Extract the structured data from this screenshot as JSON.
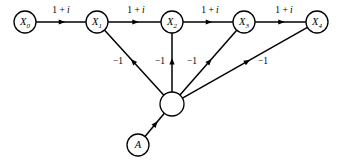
{
  "diagram": {
    "type": "signal-flow-graph",
    "title": "",
    "background_color": "#ffffff",
    "stroke_color": "#000000",
    "nodes": [
      {
        "id": "X0",
        "label": "X",
        "subscript": "0",
        "x": 25,
        "y": 22,
        "r": 11,
        "filled": false
      },
      {
        "id": "X1",
        "label": "X",
        "subscript": "1",
        "x": 97,
        "y": 22,
        "r": 11,
        "filled": false
      },
      {
        "id": "X2",
        "label": "X",
        "subscript": "2",
        "x": 172,
        "y": 22,
        "r": 11,
        "filled": false
      },
      {
        "id": "X3",
        "label": "X",
        "subscript": "3",
        "x": 244,
        "y": 22,
        "r": 11,
        "filled": false
      },
      {
        "id": "X4",
        "label": "X",
        "subscript": "4",
        "x": 317,
        "y": 22,
        "r": 11,
        "filled": false
      },
      {
        "id": "HUB",
        "label": "",
        "subscript": "",
        "x": 172,
        "y": 104,
        "r": 12,
        "filled": false
      },
      {
        "id": "A",
        "label": "A",
        "subscript": "",
        "x": 138,
        "y": 145,
        "r": 11,
        "filled": false
      }
    ],
    "edges": [
      {
        "id": "e-x0-x1",
        "from": "X0",
        "to": "X1",
        "weight": "1 + i",
        "label_x": 61,
        "label_y": 11,
        "arrow_t": 0.52
      },
      {
        "id": "e-x1-x2",
        "from": "X1",
        "to": "X2",
        "weight": "1 + i",
        "label_x": 136,
        "label_y": 11,
        "arrow_t": 0.52
      },
      {
        "id": "e-x2-x3",
        "from": "X2",
        "to": "X3",
        "weight": "1 + i",
        "label_x": 210,
        "label_y": 11,
        "arrow_t": 0.52
      },
      {
        "id": "e-x3-x4",
        "from": "X3",
        "to": "X4",
        "weight": "1 + i",
        "label_x": 284,
        "label_y": 11,
        "arrow_t": 0.52
      },
      {
        "id": "e-hub-x1",
        "from": "HUB",
        "to": "X1",
        "weight": "−1",
        "label_x": 118,
        "label_y": 62,
        "arrow_t": 0.52
      },
      {
        "id": "e-hub-x2",
        "from": "HUB",
        "to": "X2",
        "weight": "−1",
        "label_x": 160,
        "label_y": 62,
        "arrow_t": 0.52
      },
      {
        "id": "e-hub-x3",
        "from": "HUB",
        "to": "X3",
        "weight": "−1",
        "label_x": 192,
        "label_y": 62,
        "arrow_t": 0.52
      },
      {
        "id": "e-hub-x4",
        "from": "HUB",
        "to": "X4",
        "weight": "−1",
        "label_x": 263,
        "label_y": 62,
        "arrow_t": 0.52
      },
      {
        "id": "e-a-hub",
        "from": "A",
        "to": "HUB",
        "weight": "",
        "label_x": 0,
        "label_y": 0,
        "arrow_t": 0.55
      }
    ],
    "weight_labels": {
      "forward": "1 + i",
      "feedback": "−1"
    }
  }
}
